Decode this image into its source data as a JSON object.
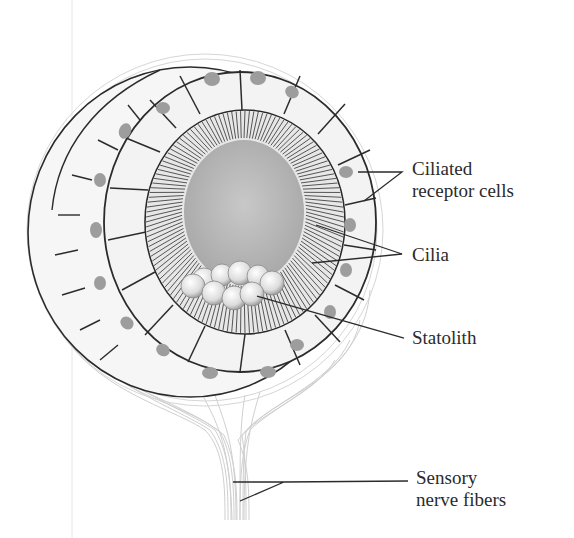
{
  "diagram": {
    "labels": {
      "ciliated_receptor_cells": [
        "Ciliated",
        "receptor cells"
      ],
      "cilia": "Cilia",
      "statolith": "Statolith",
      "sensory_nerve_fibers": [
        "Sensory",
        "nerve fibers"
      ]
    },
    "colors": {
      "outline": "#2b2b2b",
      "cell_fill": "#f2f2f2",
      "nucleus": "#9a9a9a",
      "lumen": "#bdbdbd",
      "nerve": "#c8c8c8"
    }
  }
}
